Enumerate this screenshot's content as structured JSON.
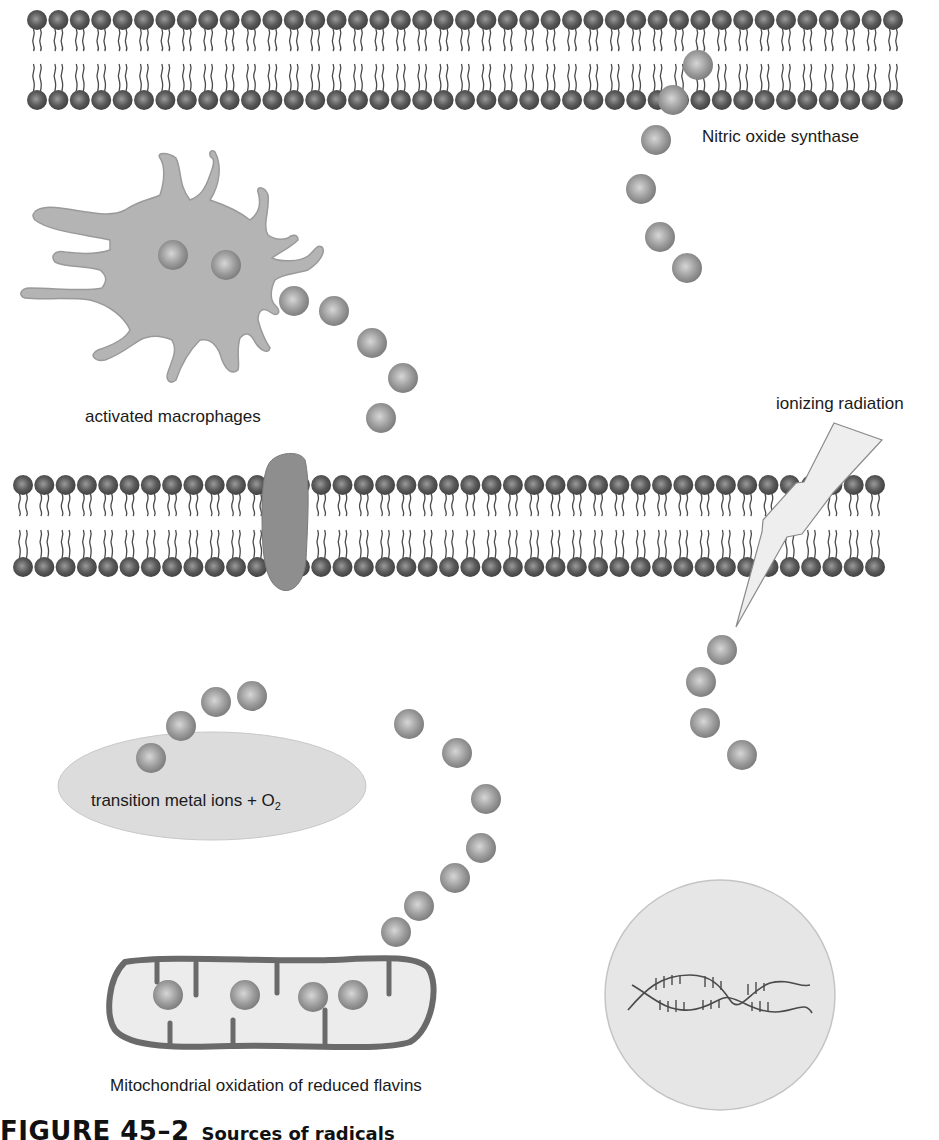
{
  "figure": {
    "caption_number": "FIGURE 45–2",
    "caption_title": "Sources of radicals",
    "labels": {
      "nos": "Nitric oxide synthase",
      "macrophages": "activated macrophages",
      "radiation": "ionizing radiation",
      "metal_main": "transition metal ions + O",
      "metal_sub": "2",
      "mitochondria": "Mitochondrial oxidation of reduced flavins"
    }
  },
  "colors": {
    "lipid_head": "#5a5a5a",
    "lipid_tail": "#4a4a4a",
    "radical": "#9a9a9a",
    "macrophage_fill": "#b4b4b4",
    "channel_fill": "#8e8e8e",
    "ellipse_fill": "#dcdcdc",
    "nucleus_fill": "#e6e6e6",
    "mito_stroke": "#6a6a6a",
    "mito_fill": "#ececec",
    "bolt_fill": "#eeeeee",
    "bolt_stroke": "#8a8a8a",
    "dna_stroke": "#4a4a4a"
  },
  "membranes": [
    {
      "name": "plasma-membrane-top",
      "x0": 37,
      "count": 41,
      "spacing": 21.4,
      "top_y": 20,
      "bottom_y": 100
    },
    {
      "name": "plasma-membrane-middle",
      "x0": 23,
      "count": 41,
      "spacing": 21.3,
      "top_y": 485,
      "bottom_y": 567
    }
  ],
  "radicals": {
    "nos_stream": [
      [
        698,
        65
      ],
      [
        673,
        100
      ],
      [
        656,
        140
      ],
      [
        641,
        189
      ],
      [
        660,
        237
      ],
      [
        687,
        268
      ]
    ],
    "macrophage_inside": [
      [
        173,
        255
      ],
      [
        226,
        265
      ]
    ],
    "macrophage_stream": [
      [
        294,
        301
      ],
      [
        334,
        311
      ],
      [
        372,
        343
      ],
      [
        403,
        378
      ],
      [
        381,
        418
      ]
    ],
    "radiation_stream": [
      [
        722,
        650
      ],
      [
        701,
        682
      ],
      [
        705,
        723
      ],
      [
        742,
        755
      ]
    ],
    "metal_stream": [
      [
        151,
        758
      ],
      [
        181,
        726
      ],
      [
        216,
        702
      ],
      [
        252,
        696
      ]
    ],
    "mito_stream": [
      [
        409,
        724
      ],
      [
        457,
        753
      ],
      [
        486,
        799
      ],
      [
        481,
        848
      ],
      [
        455,
        878
      ],
      [
        419,
        906
      ],
      [
        396,
        932
      ]
    ],
    "mito_inside": [
      [
        168,
        995
      ],
      [
        245,
        995
      ],
      [
        313,
        997
      ],
      [
        353,
        995
      ]
    ]
  }
}
